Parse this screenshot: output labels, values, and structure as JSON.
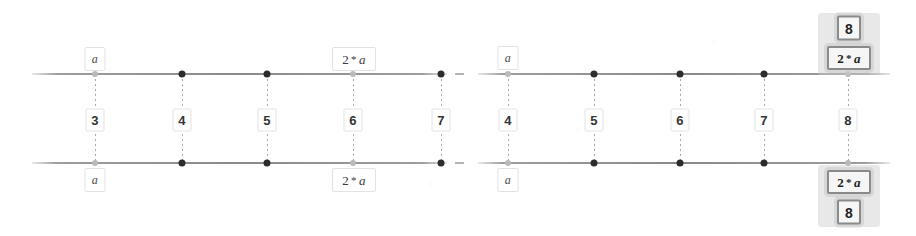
{
  "diagram": {
    "background_color": "#ffffff",
    "rail_color": "#6e6e6e",
    "node_color": "#2c2c2c",
    "label_border_color": "#e2e2e2",
    "selected_border_color": "#8a8a8a",
    "selected_fill_color": "#f6f6f6",
    "operator": "*"
  },
  "panels": [
    {
      "name": "left-panel",
      "columns": [
        {
          "index_label": "3",
          "top_label": "a",
          "bottom_label": "a",
          "top_selected": false,
          "bottom_selected": false,
          "node_faded": true
        },
        {
          "index_label": "4",
          "top_label": "",
          "bottom_label": "",
          "top_selected": false,
          "bottom_selected": false,
          "node_faded": false
        },
        {
          "index_label": "5",
          "top_label": "",
          "bottom_label": "",
          "top_selected": false,
          "bottom_selected": false,
          "node_faded": false
        },
        {
          "index_label": "6",
          "top_label": "2 * a",
          "bottom_label": "2 * a",
          "top_selected": false,
          "bottom_selected": false,
          "node_faded": true
        },
        {
          "index_label": "7",
          "top_label": "",
          "bottom_label": "",
          "top_selected": false,
          "bottom_selected": false,
          "node_faded": false
        }
      ]
    },
    {
      "name": "right-panel",
      "columns": [
        {
          "index_label": "4",
          "top_label": "a",
          "bottom_label": "a",
          "top_selected": false,
          "bottom_selected": false,
          "node_faded": true
        },
        {
          "index_label": "5",
          "top_label": "",
          "bottom_label": "",
          "top_selected": false,
          "bottom_selected": false,
          "node_faded": false
        },
        {
          "index_label": "6",
          "top_label": "",
          "bottom_label": "",
          "top_selected": false,
          "bottom_selected": false,
          "node_faded": false
        },
        {
          "index_label": "7",
          "top_label": "",
          "bottom_label": "",
          "top_selected": false,
          "bottom_selected": false,
          "node_faded": false
        },
        {
          "index_label": "8",
          "top_label": "2 * a",
          "bottom_label": "2 * a",
          "top_selected": true,
          "bottom_selected": true,
          "node_faded": true,
          "top_badge": "8",
          "bottom_badge": "8"
        }
      ]
    }
  ],
  "labels": {
    "var_a": "a",
    "expr_two_a_prefix": "2",
    "expr_two_a_operator": "*",
    "expr_two_a_suffix": "a",
    "badge_eight": "8"
  }
}
